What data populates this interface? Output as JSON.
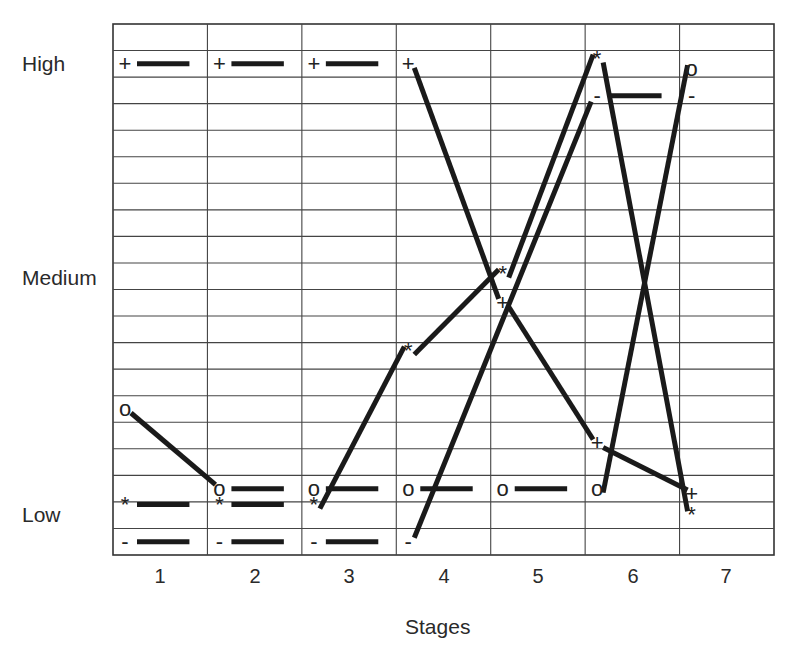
{
  "chart_data": {
    "type": "line",
    "title": "",
    "xlabel": "Stages",
    "ylabel": "",
    "categories": [
      "1",
      "2",
      "3",
      "4",
      "5",
      "6",
      "7"
    ],
    "y_levels": [
      "Low",
      "Medium",
      "High"
    ],
    "ylim": [
      0,
      20
    ],
    "grid": true,
    "legend": "none (series identified by marker symbols)",
    "series": [
      {
        "name": "+",
        "marker": "+",
        "values": [
          18.5,
          18.5,
          18.5,
          18.5,
          9.5,
          4.2,
          2.3
        ],
        "segments": [
          [
            1,
            2,
            "flat"
          ],
          [
            2,
            3,
            "flat"
          ],
          [
            3,
            4,
            "flat"
          ]
        ]
      },
      {
        "name": "o",
        "marker": "o",
        "values": [
          5.5,
          2.5,
          2.5,
          2.5,
          2.5,
          2.5,
          18.3
        ],
        "segments": [
          [
            2,
            3,
            "flat"
          ],
          [
            3,
            4,
            "flat"
          ],
          [
            4,
            5,
            "flat"
          ],
          [
            5,
            6,
            "flat"
          ]
        ]
      },
      {
        "name": "*",
        "marker": "*",
        "values": [
          1.9,
          1.9,
          1.9,
          7.7,
          10.6,
          18.7,
          1.5
        ],
        "segments": [
          [
            1,
            2,
            "flat"
          ],
          [
            2,
            3,
            "flat"
          ]
        ]
      },
      {
        "name": "-",
        "marker": "-",
        "values": [
          0.5,
          0.5,
          0.5,
          0.5,
          null,
          17.3,
          17.3
        ],
        "segments": [
          [
            1,
            2,
            "flat"
          ],
          [
            2,
            3,
            "flat"
          ],
          [
            3,
            4,
            "flat"
          ],
          [
            6,
            7,
            "flat"
          ]
        ]
      }
    ]
  },
  "labels": {
    "y_high": "High",
    "y_medium": "Medium",
    "y_low": "Low",
    "x_title": "Stages",
    "x_ticks": [
      "1",
      "2",
      "3",
      "4",
      "5",
      "6",
      "7"
    ]
  }
}
